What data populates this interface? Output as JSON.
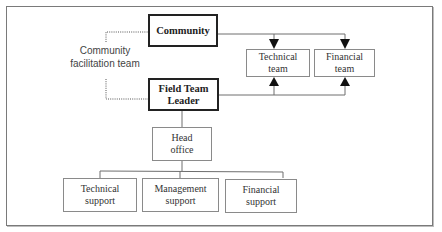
{
  "diagram": {
    "type": "organizational-chart",
    "nodes": {
      "community": {
        "label": "Community"
      },
      "field_team_leader": {
        "label": "Field Team\nLeader"
      },
      "community_facilitation_team": {
        "label": "Community\nfacilitation team"
      },
      "technical_team": {
        "label": "Technical\nteam"
      },
      "financial_team": {
        "label": "Financial\nteam"
      },
      "head_office": {
        "label": "Head\noffice"
      },
      "technical_support": {
        "label": "Technical\nsupport"
      },
      "management_support": {
        "label": "Management\nsupport"
      },
      "financial_support": {
        "label": "Financial\nsupport"
      }
    },
    "edges": [
      {
        "from": "community",
        "to": "technical_team",
        "style": "solid",
        "arrow": "down"
      },
      {
        "from": "community",
        "to": "financial_team",
        "style": "solid",
        "arrow": "down"
      },
      {
        "from": "field_team_leader",
        "to": "technical_team",
        "style": "solid",
        "arrow": "up"
      },
      {
        "from": "field_team_leader",
        "to": "financial_team",
        "style": "solid",
        "arrow": "up"
      },
      {
        "from": "community_facilitation_team",
        "to": "community",
        "style": "dotted"
      },
      {
        "from": "community_facilitation_team",
        "to": "field_team_leader",
        "style": "dotted"
      },
      {
        "from": "field_team_leader",
        "to": "head_office",
        "style": "solid"
      },
      {
        "from": "head_office",
        "to": "technical_support",
        "style": "solid"
      },
      {
        "from": "head_office",
        "to": "management_support",
        "style": "solid"
      },
      {
        "from": "head_office",
        "to": "financial_support",
        "style": "solid"
      }
    ],
    "colors": {
      "line": "#6e6e6e",
      "bold_border": "#222222",
      "arrow": "#111111",
      "frame": "#7a7a7a"
    }
  }
}
